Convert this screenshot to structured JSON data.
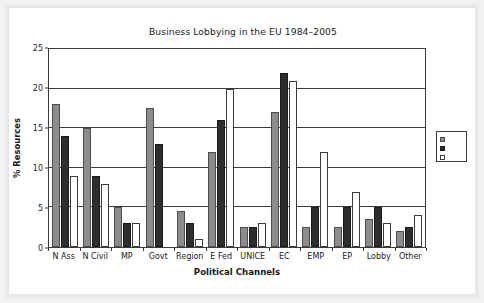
{
  "chart_data": {
    "type": "bar",
    "title": "Business Lobbying in the EU 1984–2005",
    "xlabel": "Political Channels",
    "ylabel": "% Resources",
    "ylim": [
      0,
      25
    ],
    "yticks": [
      0,
      5,
      10,
      15,
      20,
      25
    ],
    "grid": true,
    "legend_position": "right-outside",
    "categories": [
      "N Ass",
      "N Civil",
      "MP",
      "Govt",
      "Region",
      "E Fed",
      "UNICE",
      "EC",
      "EMP",
      "EP",
      "Lobby",
      "Other"
    ],
    "series": [
      {
        "name": "",
        "swatch": "gray",
        "color": "#8c8c8c",
        "values": [
          18,
          15,
          5,
          17.5,
          4.5,
          12,
          2.5,
          17,
          2.5,
          2.5,
          3.5,
          2
        ]
      },
      {
        "name": "",
        "swatch": "black",
        "color": "#2e2e2e",
        "values": [
          14,
          9,
          3,
          13,
          3,
          16,
          2.5,
          22,
          5,
          5,
          5,
          2.5
        ]
      },
      {
        "name": "",
        "swatch": "white",
        "color": "#ffffff",
        "values": [
          9,
          8,
          3,
          0,
          1,
          20,
          3,
          21,
          12,
          7,
          3,
          4
        ]
      }
    ]
  },
  "legend": {
    "entries": [
      {
        "label": "",
        "swatch": "gray"
      },
      {
        "label": "",
        "swatch": "black"
      },
      {
        "label": "",
        "swatch": "white"
      }
    ]
  }
}
